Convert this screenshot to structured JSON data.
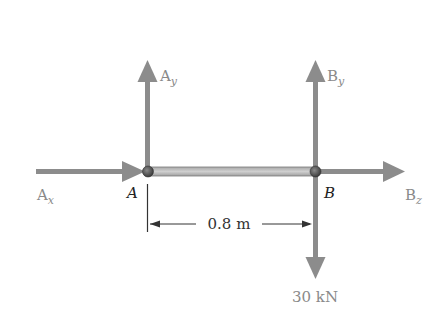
{
  "diagram": {
    "type": "free-body diagram",
    "beam": {
      "from": "A",
      "to": "B",
      "length_label": "0.8 m"
    },
    "points": [
      {
        "id": "A",
        "label": "A"
      },
      {
        "id": "B",
        "label": "B"
      }
    ],
    "forces": [
      {
        "id": "Ax",
        "base": "A",
        "sub": "x",
        "direction": "right",
        "at": "A"
      },
      {
        "id": "Ay",
        "base": "A",
        "sub": "y",
        "direction": "up",
        "at": "A"
      },
      {
        "id": "By",
        "base": "B",
        "sub": "y",
        "direction": "up",
        "at": "B"
      },
      {
        "id": "Bz",
        "base": "B",
        "sub": "z",
        "direction": "right",
        "at": "B"
      },
      {
        "id": "load",
        "label": "30 kN",
        "direction": "down",
        "at": "B"
      }
    ],
    "colors": {
      "arrow": "#8c8c8c",
      "beam_fill": "#bdbdbd",
      "beam_edge": "#7a7a7a",
      "pin": "#555555",
      "text_gray": "#8a8a8a",
      "text_dark": "#222222"
    }
  }
}
